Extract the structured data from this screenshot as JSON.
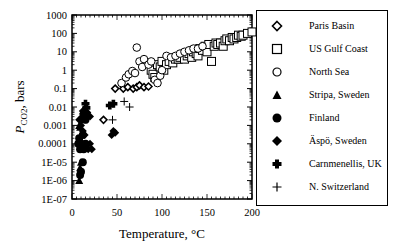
{
  "chart_data": {
    "type": "scatter",
    "title": "",
    "xlabel": "Temperature, °C",
    "ylabel": "P_CO2, bars",
    "ylabel_main": "P",
    "ylabel_sub": "CO2",
    "ylabel_rest": ", bars",
    "xlim": [
      0,
      200
    ],
    "ylim": [
      1e-07,
      1000
    ],
    "yscale": "log",
    "grid": false,
    "legend_position": "right",
    "x_ticks": [
      "0",
      "50",
      "100",
      "150",
      "200"
    ],
    "y_ticks": [
      "1000",
      "100",
      "10",
      "1",
      "0.1",
      "0.01",
      "0.001",
      "0.0001",
      "1E-05",
      "1E-06",
      "1E-07"
    ],
    "series": [
      {
        "name": "Paris Basin",
        "marker": "diamond-open",
        "points": [
          [
            35,
            0.002
          ],
          [
            48,
            0.1
          ],
          [
            57,
            0.1
          ],
          [
            62,
            0.12
          ],
          [
            68,
            0.1
          ],
          [
            72,
            0.12
          ],
          [
            75,
            0.15
          ],
          [
            80,
            0.12
          ],
          [
            85,
            0.13
          ]
        ]
      },
      {
        "name": "US Gulf Coast",
        "marker": "square-open",
        "points": [
          [
            88,
            1
          ],
          [
            90,
            0.6
          ],
          [
            92,
            0.4
          ],
          [
            95,
            2
          ],
          [
            98,
            1.5
          ],
          [
            100,
            3
          ],
          [
            102,
            1
          ],
          [
            105,
            2
          ],
          [
            108,
            3
          ],
          [
            112,
            2.5
          ],
          [
            115,
            4
          ],
          [
            118,
            4
          ],
          [
            120,
            5
          ],
          [
            125,
            4
          ],
          [
            128,
            6
          ],
          [
            130,
            8
          ],
          [
            133,
            5
          ],
          [
            135,
            10
          ],
          [
            138,
            8
          ],
          [
            140,
            6
          ],
          [
            142,
            15
          ],
          [
            145,
            12
          ],
          [
            148,
            20
          ],
          [
            150,
            10
          ],
          [
            152,
            25
          ],
          [
            155,
            3
          ],
          [
            158,
            20
          ],
          [
            160,
            30
          ],
          [
            162,
            25
          ],
          [
            165,
            30
          ],
          [
            168,
            20
          ],
          [
            170,
            40
          ],
          [
            172,
            50
          ],
          [
            175,
            40
          ],
          [
            178,
            60
          ],
          [
            180,
            50
          ],
          [
            183,
            60
          ],
          [
            185,
            80
          ],
          [
            188,
            70
          ],
          [
            190,
            80
          ],
          [
            195,
            100
          ],
          [
            200,
            120
          ]
        ]
      },
      {
        "name": "North Sea",
        "marker": "circle-open",
        "points": [
          [
            55,
            0.2
          ],
          [
            60,
            0.4
          ],
          [
            63,
            0.6
          ],
          [
            67,
            0.9
          ],
          [
            70,
            0.7
          ],
          [
            72,
            17
          ],
          [
            75,
            3
          ],
          [
            78,
            1.5
          ],
          [
            80,
            4
          ],
          [
            85,
            2
          ],
          [
            88,
            3
          ],
          [
            92,
            0.3
          ],
          [
            95,
            0.2
          ],
          [
            98,
            0.5
          ],
          [
            100,
            1
          ],
          [
            105,
            6
          ],
          [
            110,
            5
          ],
          [
            115,
            6
          ],
          [
            120,
            8
          ],
          [
            125,
            10
          ],
          [
            130,
            12
          ],
          [
            135,
            15
          ],
          [
            140,
            15
          ],
          [
            145,
            20
          ]
        ]
      },
      {
        "name": "Stripa, Sweden",
        "marker": "triangle-filled",
        "points": [
          [
            8,
            1e-06
          ],
          [
            9,
            5e-06
          ],
          [
            10,
            1e-05
          ],
          [
            8,
            0.001
          ],
          [
            10,
            0.003
          ],
          [
            12,
            0.006
          ],
          [
            13,
            0.002
          ],
          [
            9,
            0.0008
          ]
        ]
      },
      {
        "name": "Finland",
        "marker": "circle-filled",
        "points": [
          [
            7,
            0.0001
          ],
          [
            8,
            0.0002
          ],
          [
            9,
            5e-05
          ],
          [
            10,
            0.0001
          ],
          [
            12,
            0.0003
          ],
          [
            13,
            5e-05
          ],
          [
            15,
            0.0001
          ],
          [
            10,
            3e-06
          ],
          [
            12,
            1e-05
          ],
          [
            9,
            2e-06
          ],
          [
            14,
            0.004
          ],
          [
            15,
            0.002
          ]
        ]
      },
      {
        "name": "Äspö, Sweden",
        "marker": "diamond-filled",
        "points": [
          [
            8,
            0.002
          ],
          [
            10,
            0.001
          ],
          [
            12,
            0.0005
          ],
          [
            14,
            0.0003
          ],
          [
            16,
            0.0001
          ],
          [
            18,
            5e-05
          ],
          [
            20,
            0.0001
          ],
          [
            22,
            5e-05
          ],
          [
            44,
            0.0003
          ],
          [
            46,
            0.0005
          ],
          [
            48,
            0.0004
          ],
          [
            12,
            0.006
          ],
          [
            17,
            0.005
          ],
          [
            20,
            0.003
          ]
        ]
      },
      {
        "name": "Carnmenellis, UK",
        "marker": "plus-filled",
        "points": [
          [
            15,
            0.015
          ],
          [
            16,
            0.009
          ],
          [
            42,
            0.012
          ],
          [
            46,
            0.015
          ]
        ]
      },
      {
        "name": "N. Switzerland",
        "marker": "plus",
        "points": [
          [
            45,
            0.002
          ],
          [
            58,
            0.02
          ],
          [
            64,
            0.01
          ]
        ]
      }
    ]
  },
  "legend": {
    "items": [
      {
        "label": "Paris Basin",
        "icon": "diamond-open"
      },
      {
        "label": "US Gulf Coast",
        "icon": "square-open"
      },
      {
        "label": "North Sea",
        "icon": "circle-open"
      },
      {
        "label": "Stripa, Sweden",
        "icon": "triangle-filled"
      },
      {
        "label": "Finland",
        "icon": "circle-filled"
      },
      {
        "label": "Äspö, Sweden",
        "icon": "diamond-filled"
      },
      {
        "label": "Carnmenellis, UK",
        "icon": "plus-filled"
      },
      {
        "label": "N. Switzerland",
        "icon": "plus"
      }
    ]
  }
}
